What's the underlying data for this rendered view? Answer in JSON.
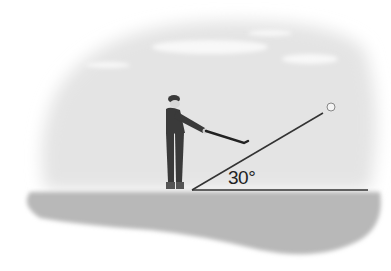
{
  "figure": {
    "angle_label": "30°",
    "angle_degrees": 30,
    "object": "golf-ball",
    "colors": {
      "sky": "#e6e6e6",
      "ground": "#b5b5b5",
      "cloud": "#f7f7f7",
      "figure": "#3a3a3a",
      "line": "#333333"
    }
  }
}
